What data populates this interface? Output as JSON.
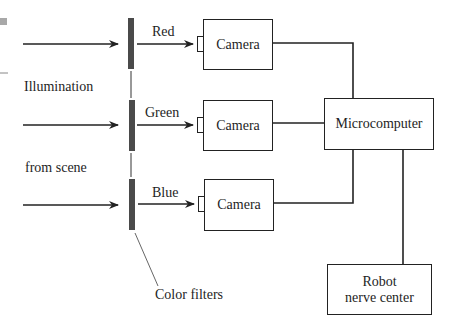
{
  "diagram": {
    "type": "block-diagram",
    "left_labels": {
      "illumination": "Illumination",
      "from_scene": "from scene"
    },
    "channels": [
      {
        "color_label": "Red",
        "camera_label": "Camera"
      },
      {
        "color_label": "Green",
        "camera_label": "Camera"
      },
      {
        "color_label": "Blue",
        "camera_label": "Camera"
      }
    ],
    "filters_label": "Color filters",
    "microcomputer_label": "Microcomputer",
    "robot": {
      "line1": "Robot",
      "line2": "nerve center"
    },
    "colors": {
      "line": "#222222",
      "filter": "#4a4a4a",
      "corner_mark": "#a8a8a8"
    }
  }
}
